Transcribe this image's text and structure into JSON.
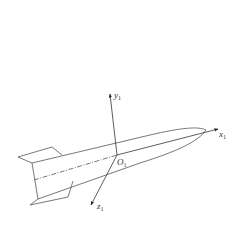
{
  "diagram": {
    "origin_label": {
      "base": "O",
      "sub": "1"
    },
    "axes": [
      {
        "name": "x-axis",
        "base": "x",
        "sub": "1",
        "direction": "along body toward nose"
      },
      {
        "name": "y-axis",
        "base": "y",
        "sub": "1",
        "direction": "up, perpendicular to body"
      },
      {
        "name": "z-axis",
        "base": "z",
        "sub": "1",
        "direction": "down-left, out of plane"
      }
    ],
    "object": "rocket with tail fins",
    "colors": {
      "line": "#555555",
      "background": "#ffffff"
    }
  },
  "caption": ""
}
